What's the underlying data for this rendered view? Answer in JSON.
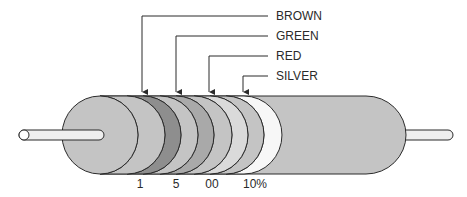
{
  "diagram": {
    "type": "resistor-color-code",
    "bands": [
      {
        "color_name": "BROWN",
        "value": "1",
        "fill": "#8e8e8e"
      },
      {
        "color_name": "GREEN",
        "value": "5",
        "fill": "#a9a9a9"
      },
      {
        "color_name": "RED",
        "value": "00",
        "fill": "#dadada"
      },
      {
        "color_name": "SILVER",
        "value": "10%",
        "fill": "#f7f7f7"
      }
    ],
    "colors": {
      "body": "#c4c4c4",
      "lead": "#eeeeee",
      "outline": "#2b2b2b"
    }
  }
}
